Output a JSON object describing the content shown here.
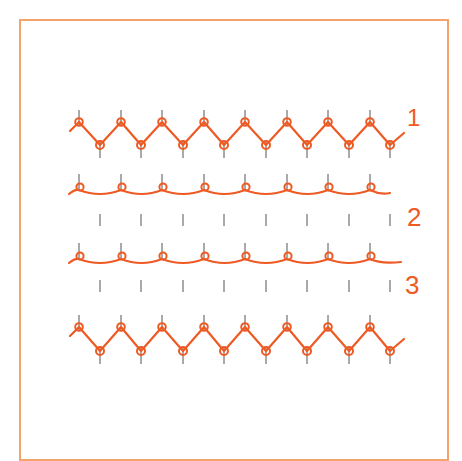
{
  "diagram": {
    "type": "knitting-stitch-illustration",
    "frame_color": "#f4a46a",
    "yarn_color": "#ee5a24",
    "needle_color": "#555555",
    "rows": [
      {
        "id": 1,
        "label": "1",
        "style": "zigzag",
        "top_needles_x": [
          79,
          121,
          162,
          204,
          245,
          287,
          328,
          370
        ],
        "bottom_needles_x": [
          100,
          141,
          183,
          224,
          266,
          307,
          349,
          390
        ],
        "top_y": 122,
        "bottom_y": 145
      },
      {
        "id": 2,
        "label": "2",
        "style": "wavy",
        "top_needles_x": [
          79,
          121,
          162,
          204,
          245,
          287,
          328,
          370
        ],
        "bottom_ticks_x": [
          100,
          141,
          183,
          224,
          266,
          307,
          349,
          390
        ],
        "loop_y": 187,
        "tick_y": 220
      },
      {
        "id": 3,
        "label": "3",
        "style": "wavy",
        "top_needles_x": [
          79,
          121,
          162,
          204,
          245,
          287,
          328,
          370
        ],
        "bottom_ticks_x": [
          100,
          141,
          183,
          224,
          266,
          307,
          349,
          390
        ],
        "loop_y": 256,
        "tick_y": 286
      },
      {
        "id": 4,
        "label": "",
        "style": "zigzag",
        "top_needles_x": [
          79,
          121,
          162,
          204,
          245,
          287,
          328,
          370
        ],
        "bottom_needles_x": [
          100,
          141,
          183,
          224,
          266,
          307,
          349,
          390
        ],
        "top_y": 327,
        "bottom_y": 351
      }
    ]
  }
}
